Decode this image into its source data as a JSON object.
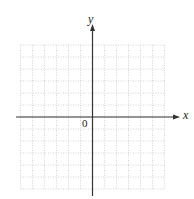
{
  "diagram": {
    "type": "coordinate-grid",
    "axes": {
      "x_label": "x",
      "y_label": "y",
      "origin_label": "0"
    },
    "grid": {
      "columns": 12,
      "rows": 12,
      "style": "dotted",
      "line_color": "#c8c8c8",
      "axis_color": "#333333"
    }
  }
}
